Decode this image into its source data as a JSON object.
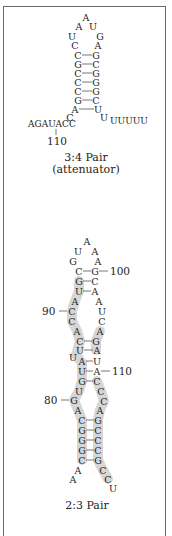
{
  "hairpin_34": {
    "caption_line1": "3:4 Pair",
    "caption_line2": "(attenuator)",
    "loop_top": "A",
    "left_strand": [
      "A",
      "U",
      "C"
    ],
    "right_strand": [
      "U",
      "G",
      "A"
    ],
    "stem_pairs": [
      [
        "C",
        "G"
      ],
      [
        "G",
        "C"
      ],
      [
        "C",
        "G"
      ],
      [
        "C",
        "G"
      ],
      [
        "C",
        "G"
      ],
      [
        "G",
        "C"
      ],
      [
        "A",
        "U"
      ]
    ],
    "left_tail_end": "C",
    "right_tail_start": "U",
    "left_tail": "AGAUACC",
    "right_tail": "UUUUU",
    "position_label": "110"
  },
  "hairpin_23": {
    "caption": "2:3 Pair",
    "loop_top": "A",
    "labels": {
      "p100": "100",
      "p90": "90",
      "p110": "110",
      "p80": "80"
    },
    "left_nts": [
      "U",
      "G",
      "C",
      "G",
      "U",
      "A",
      "C",
      "C",
      "A",
      "C",
      "U",
      "U",
      "A",
      "U",
      "G",
      "U",
      "G",
      "A",
      "C",
      "G",
      "G",
      "G",
      "C",
      "A",
      "A"
    ],
    "right_nts": [
      "A",
      "A",
      "G",
      "C",
      "A",
      "A",
      "U",
      "C",
      "A",
      "G",
      "A",
      "U",
      "A",
      "C",
      "C",
      "C",
      "A",
      "G",
      "C",
      "C",
      "C",
      "G",
      "C",
      "C",
      "U"
    ]
  }
}
